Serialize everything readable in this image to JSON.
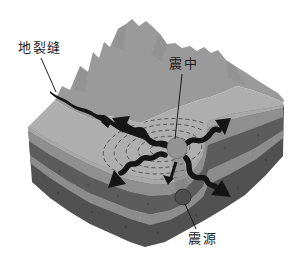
{
  "diagram": {
    "labels": {
      "ground_fissure": "地裂缝",
      "epicenter": "震中",
      "hypocenter": "震源"
    },
    "colors": {
      "background": "#ffffff",
      "mountain": "#9a9a9a",
      "surface": "#aeaeae",
      "surface_edge": "#a8a8a8",
      "strata_light_upper": "#8f8f8f",
      "strata_dark_upper": "#5c5c5c",
      "strata_light_lower": "#8c8c8c",
      "strata_dark_lower": "#515151",
      "wave_ring": "#4d4d4d",
      "ink": "#151515",
      "epicenter_dot": "#949494",
      "hypocenter_dot": "#4e4e4e"
    }
  }
}
